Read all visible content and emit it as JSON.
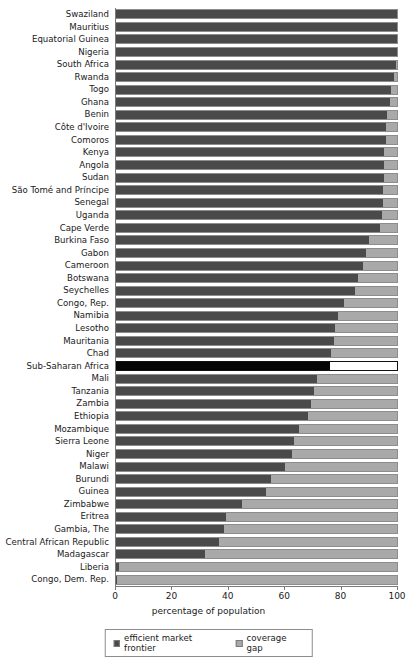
{
  "chart_data": {
    "type": "bar",
    "orientation": "horizontal",
    "stacked": true,
    "title": "",
    "xlabel": "percentage of population",
    "ylabel": "",
    "xlim": [
      0,
      100
    ],
    "xticks": [
      0,
      20,
      40,
      60,
      80,
      100
    ],
    "grid": false,
    "legend_position": "bottom",
    "colors": {
      "efficient_market_frontier": "#4a4a4a",
      "coverage_gap": "#a9a9a9",
      "highlight_frontier": "#050505",
      "highlight_gap": "#ffffff",
      "axis": "#7a7a7a",
      "text": "#1a1a1a"
    },
    "categories": [
      "Swaziland",
      "Mauritius",
      "Equatorial Guinea",
      "Nigeria",
      "South Africa",
      "Rwanda",
      "Togo",
      "Ghana",
      "Benin",
      "Côte d'Ivoire",
      "Comoros",
      "Kenya",
      "Angola",
      "Sudan",
      "São Tomé and Príncipe",
      "Senegal",
      "Uganda",
      "Cape Verde",
      "Burkina Faso",
      "Gabon",
      "Cameroon",
      "Botswana",
      "Seychelles",
      "Congo, Rep.",
      "Namibia",
      "Lesotho",
      "Mauritania",
      "Chad",
      "Sub-Saharan Africa",
      "Mali",
      "Tanzania",
      "Zambia",
      "Ethiopia",
      "Mozambique",
      "Sierra Leone",
      "Niger",
      "Malawi",
      "Burundi",
      "Guinea",
      "Zimbabwe",
      "Eritrea",
      "Gambia, The",
      "Central African Republic",
      "Madagascar",
      "Liberia",
      "Congo, Dem. Rep."
    ],
    "series": [
      {
        "name": "efficient market frontier",
        "values": [
          100,
          100,
          100,
          100,
          99.5,
          99,
          98,
          97.5,
          96.5,
          96,
          96,
          95.5,
          95.5,
          95.5,
          95,
          95,
          94.5,
          94,
          90,
          89,
          88,
          86,
          85,
          81,
          79,
          78,
          77.5,
          76.5,
          76,
          71.5,
          70.5,
          69.5,
          68.5,
          65,
          63.5,
          62.5,
          60,
          55,
          53.5,
          45,
          39,
          38.5,
          36.5,
          31.5,
          1,
          0.5
        ]
      },
      {
        "name": "coverage gap",
        "values": [
          0,
          0,
          0,
          0,
          0.5,
          1,
          2,
          2.5,
          3.5,
          4,
          4,
          4.5,
          4.5,
          4.5,
          5,
          5,
          5.5,
          6,
          10,
          11,
          12,
          14,
          15,
          19,
          21,
          22,
          22.5,
          23.5,
          24,
          28.5,
          29.5,
          30.5,
          31.5,
          35,
          36.5,
          37.5,
          40,
          45,
          46.5,
          55,
          61,
          61.5,
          63.5,
          68.5,
          99,
          99.5
        ]
      }
    ],
    "highlight_category": "Sub-Saharan Africa",
    "legend": [
      {
        "label": "efficient market frontier",
        "swatch": "frontier"
      },
      {
        "label": "coverage gap",
        "swatch": "gap"
      }
    ]
  }
}
